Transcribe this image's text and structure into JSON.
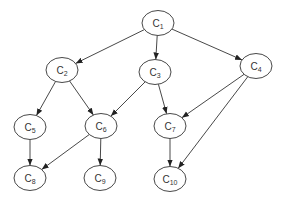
{
  "diagram": {
    "type": "directed-acyclic-graph",
    "nodes": [
      {
        "id": "C1",
        "base": "C",
        "sub": "1",
        "cx": 158,
        "cy": 23
      },
      {
        "id": "C2",
        "base": "C",
        "sub": "2",
        "cx": 62,
        "cy": 70
      },
      {
        "id": "C3",
        "base": "C",
        "sub": "3",
        "cx": 155,
        "cy": 72
      },
      {
        "id": "C4",
        "base": "C",
        "sub": "4",
        "cx": 256,
        "cy": 66
      },
      {
        "id": "C5",
        "base": "C",
        "sub": "5",
        "cx": 30,
        "cy": 127
      },
      {
        "id": "C6",
        "base": "C",
        "sub": "6",
        "cx": 101,
        "cy": 126
      },
      {
        "id": "C7",
        "base": "C",
        "sub": "7",
        "cx": 170,
        "cy": 126
      },
      {
        "id": "C8",
        "base": "C",
        "sub": "8",
        "cx": 30,
        "cy": 178
      },
      {
        "id": "C9",
        "base": "C",
        "sub": "9",
        "cx": 100,
        "cy": 178
      },
      {
        "id": "C10",
        "base": "C",
        "sub": "10",
        "cx": 170,
        "cy": 179
      }
    ],
    "edges": [
      {
        "from": "C1",
        "to": "C2"
      },
      {
        "from": "C1",
        "to": "C3"
      },
      {
        "from": "C1",
        "to": "C4"
      },
      {
        "from": "C2",
        "to": "C5"
      },
      {
        "from": "C2",
        "to": "C6"
      },
      {
        "from": "C3",
        "to": "C6"
      },
      {
        "from": "C3",
        "to": "C7"
      },
      {
        "from": "C4",
        "to": "C7"
      },
      {
        "from": "C4",
        "to": "C10"
      },
      {
        "from": "C5",
        "to": "C8"
      },
      {
        "from": "C6",
        "to": "C8"
      },
      {
        "from": "C6",
        "to": "C9"
      },
      {
        "from": "C7",
        "to": "C10"
      }
    ],
    "node_rx": 16,
    "node_ry": 12.5,
    "colors": {
      "stroke": "#333333",
      "fill": "#ffffff",
      "background": "#ffffff"
    }
  }
}
